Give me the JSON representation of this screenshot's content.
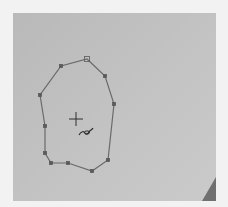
{
  "canvas": {
    "background": "#c0c0c0",
    "bounds": {
      "x": 13,
      "y": 13,
      "width": 203,
      "height": 188
    }
  },
  "lasso_selection": {
    "stroke_color": "#6a6a6a",
    "handle_color": "#5a5a5a",
    "start_handle": {
      "x": 87,
      "y": 59
    },
    "vertices": [
      {
        "x": 87,
        "y": 59
      },
      {
        "x": 105,
        "y": 76
      },
      {
        "x": 114,
        "y": 104
      },
      {
        "x": 108,
        "y": 160
      },
      {
        "x": 92,
        "y": 171
      },
      {
        "x": 68,
        "y": 163
      },
      {
        "x": 51,
        "y": 163
      },
      {
        "x": 45,
        "y": 153
      },
      {
        "x": 45,
        "y": 126
      },
      {
        "x": 40,
        "y": 95
      },
      {
        "x": 61,
        "y": 66
      }
    ]
  },
  "cursor": {
    "type": "polygonal-lasso",
    "crosshair": {
      "x": 76,
      "y": 119
    }
  },
  "corner_marker": {
    "color": "#707070"
  }
}
